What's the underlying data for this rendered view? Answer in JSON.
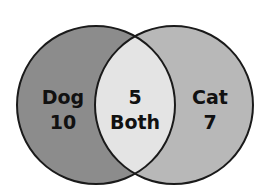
{
  "venn": {
    "left": {
      "label": "Dog",
      "value": "10",
      "color": "#8c8c8c"
    },
    "right": {
      "label": "Cat",
      "value": "7",
      "color": "#b8b8b8"
    },
    "overlap": {
      "value": "5",
      "label": "Both",
      "color": "#e4e4e4"
    },
    "stroke": "#1a1a1a"
  }
}
